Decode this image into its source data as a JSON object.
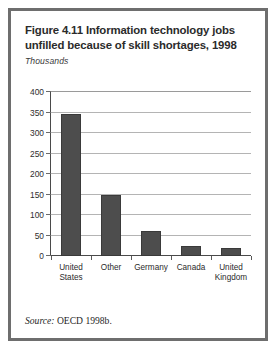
{
  "figure": {
    "title_line1": "Figure 4.11  Information technology jobs",
    "title_line2": "unfilled because of skill shortages, 1998",
    "units_label": "Thousands",
    "source_label": "Source:",
    "source_text": " OECD 1998b."
  },
  "colors": {
    "bar_fill": "#4d4d4d",
    "bar_stroke": "#3a3a3a",
    "gridline": "#b4b4b4",
    "axis": "#4a4a4a",
    "frame": "#6e6e6e",
    "text": "#2b2b2b"
  },
  "chart_data": {
    "type": "bar",
    "title": "Figure 4.11  Information technology jobs unfilled because of skill shortages, 1998",
    "xlabel": "",
    "ylabel": "Thousands",
    "ylim": [
      0,
      400
    ],
    "yticks": [
      0,
      50,
      100,
      150,
      200,
      250,
      300,
      350,
      400
    ],
    "ytick_labels": [
      "0",
      "50",
      "100",
      "150",
      "200",
      "250",
      "300",
      "350",
      "400"
    ],
    "grid": true,
    "legend": false,
    "categories": [
      "United States",
      "Other",
      "Germany",
      "Canada",
      "United Kingdom"
    ],
    "category_label_lines": [
      [
        "United",
        "States"
      ],
      [
        "Other"
      ],
      [
        "Germany"
      ],
      [
        "Canada"
      ],
      [
        "United",
        "Kingdom"
      ]
    ],
    "values": [
      346,
      148,
      60,
      25,
      20
    ],
    "source": "OECD 1998b."
  }
}
